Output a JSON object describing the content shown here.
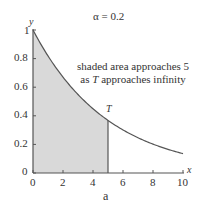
{
  "chart_data": {
    "type": "area",
    "title": "α = 0.2",
    "function": "y = exp(-0.2 x)",
    "alpha": 0.2,
    "xlabel": "x",
    "ylabel": "y",
    "caption": "a",
    "xlim": [
      0,
      10
    ],
    "ylim": [
      0,
      1
    ],
    "x_ticks": [
      0,
      2,
      4,
      6,
      8,
      10
    ],
    "y_ticks": [
      0,
      0.2,
      0.4,
      0.6,
      0.8,
      1
    ],
    "x_tick_labels": [
      "0",
      "2",
      "4",
      "6",
      "8",
      "10"
    ],
    "y_tick_labels": [
      "0",
      "0.2",
      "0.4",
      "0.6",
      "0.8",
      "1"
    ],
    "shaded_region": {
      "x_from": 0,
      "x_to": 5,
      "label": "T"
    },
    "series": [
      {
        "name": "exp(-0.2x)",
        "x": [
          0,
          1,
          2,
          3,
          4,
          5,
          6,
          7,
          8,
          9,
          10
        ],
        "values": [
          1.0,
          0.82,
          0.67,
          0.55,
          0.45,
          0.37,
          0.3,
          0.25,
          0.2,
          0.17,
          0.14
        ]
      }
    ],
    "annotations": [
      {
        "text_line1": "shaded area approaches 5",
        "text_line2_prefix": "as ",
        "text_line2_var": "T",
        "text_line2_suffix": " approaches infinity"
      }
    ],
    "grid": false,
    "legend": "none"
  },
  "colors": {
    "axis": "#555555",
    "curve": "#555555",
    "shade": "#d8d8d8",
    "text": "#333333"
  }
}
